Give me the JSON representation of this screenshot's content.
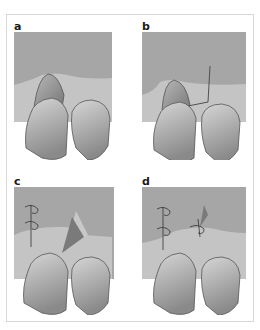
{
  "figure": {
    "panels": [
      {
        "label": "a",
        "description": "Papilla-like soft tissue cone over left tooth"
      },
      {
        "label": "b",
        "description": "Incision line drawn from papilla to gingiva"
      },
      {
        "label": "c",
        "description": "Flap rotated with sutures on left side, triangular defect"
      },
      {
        "label": "d",
        "description": "Flap sutured in place with three sutures"
      }
    ],
    "colors": {
      "mucosa": "#a6a6a6",
      "gingiva": "#c4c4c4",
      "tooth_light": "#d2d2d2",
      "tooth_dark": "#8e8e8e",
      "outline": "#555555",
      "defect": "#7a7a7a",
      "suture": "#333333"
    }
  }
}
